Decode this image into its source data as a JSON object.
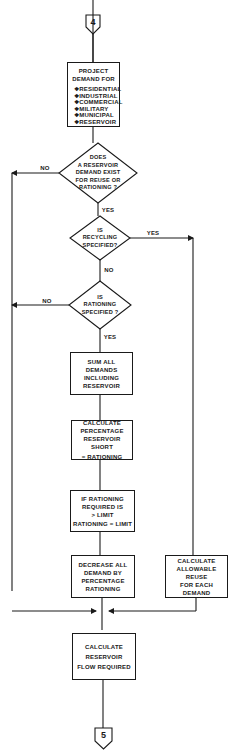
{
  "connectors": {
    "top": "4",
    "bottom": "5"
  },
  "project_demand": {
    "title_line1": "PROJECT",
    "title_line2": "DEMAND FOR",
    "items": [
      "❖RESIDENTIAL",
      "❖INDUSTRIAL",
      "❖COMMERCIAL",
      "❖MILITARY",
      "❖MUNICIPAL",
      "❖RESERVOIR"
    ]
  },
  "decision_reservoir": {
    "line1": "DOES",
    "line2": "A RESERVOIR",
    "line3": "DEMAND EXIST",
    "line4": "FOR REUSE OR",
    "line5": "RATIONING ?",
    "no_label": "NO",
    "yes_label": "YES"
  },
  "decision_recycling": {
    "line1": "IS",
    "line2": "RECYCLING",
    "line3": "SPECIFIED?",
    "yes_label": "YES",
    "no_label": "NO"
  },
  "decision_rationing": {
    "line1": "IS",
    "line2": "RATIONING",
    "line3": "SPECIFIED ?",
    "no_label": "NO",
    "yes_label": "YES"
  },
  "sum_demands": {
    "line1": "SUM ALL DEMANDS",
    "line2": "INCLUDING",
    "line3": "RESERVOIR"
  },
  "calc_percentage": {
    "line1": "CALCULATE",
    "line2": "PERCENTAGE",
    "line3": "RESERVOIR SHORT",
    "line4": "= RATIONING"
  },
  "rationing_limit": {
    "line1": "IF RATIONING",
    "line2": "REQUIRED IS",
    "line3": "> LIMIT",
    "line4": "RATIONING = LIMIT"
  },
  "decrease_demand": {
    "line1": "DECREASE ALL",
    "line2": "DEMAND BY",
    "line3": "PERCENTAGE",
    "line4": "RATIONING"
  },
  "allowable_reuse": {
    "line1": "CALCULATE",
    "line2": "ALLOWABLE",
    "line3": "REUSE",
    "line4": "FOR EACH DEMAND"
  },
  "reservoir_flow": {
    "line1": "CALCULATE",
    "line2": "RESERVOIR",
    "line3": "FLOW REQUIRED"
  }
}
